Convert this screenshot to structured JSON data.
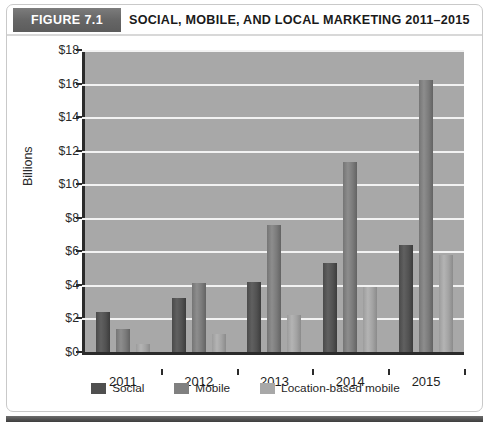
{
  "figure": {
    "tab_label": "FIGURE 7.1",
    "title": "SOCIAL, MOBILE, AND LOCAL MARKETING 2011–2015"
  },
  "legend": {
    "items": [
      {
        "label": "Social",
        "color": "#4f4f4f"
      },
      {
        "label": "Mobile",
        "color": "#808080"
      },
      {
        "label": "Location-based mobile",
        "color": "#a8a8a8"
      }
    ]
  },
  "chart_data": {
    "type": "bar",
    "title": "SOCIAL, MOBILE, AND LOCAL MARKETING 2011–2015",
    "xlabel": "",
    "ylabel": "Billions",
    "categories": [
      "2011",
      "2012",
      "2013",
      "2014",
      "2015"
    ],
    "series": [
      {
        "name": "Social",
        "color": "#4f4f4f",
        "values": [
          2.4,
          3.2,
          4.2,
          5.3,
          6.4
        ]
      },
      {
        "name": "Mobile",
        "color": "#808080",
        "values": [
          1.4,
          4.1,
          7.6,
          11.3,
          16.2
        ]
      },
      {
        "name": "Location-based mobile",
        "color": "#a8a8a8",
        "values": [
          0.5,
          1.1,
          2.2,
          3.9,
          5.8
        ]
      }
    ],
    "ylim": [
      0,
      18
    ],
    "ytick_values": [
      0,
      2,
      4,
      6,
      8,
      10,
      12,
      14,
      16,
      18
    ],
    "ytick_labels": [
      "$0",
      "$2",
      "$4",
      "$6",
      "$8",
      "$10",
      "$12",
      "$14",
      "$16",
      "$18"
    ],
    "grid": true,
    "legend_position": "bottom",
    "plot_background": "#a8a8a8",
    "gridline_color": "#f2f2f2"
  }
}
